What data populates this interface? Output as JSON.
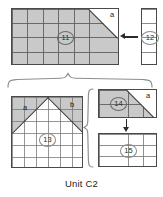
{
  "figure": {
    "caption": "Unit C2",
    "colors": {
      "shaded_fill": "#c9c9c9",
      "white_fill": "#ffffff",
      "outline": "#4a4a4a",
      "gridline": "#9a9a9a",
      "label_text": "#1a1a1a",
      "brace": "#7a7a7a",
      "arrow": "#2b2b2b"
    },
    "pieces": [
      {
        "id": "piece-11",
        "number": "11",
        "shape": "rectangle-with-corner-cut",
        "fill": "shaded",
        "grid_cols": 7,
        "grid_rows": 4,
        "corner_cut": "top-right",
        "corner_label": "a"
      },
      {
        "id": "piece-12",
        "number": "12",
        "shape": "narrow-vertical-strip",
        "fill": "white",
        "grid_cols": 1,
        "grid_rows": 4,
        "corner_cut": "none",
        "corner_label": ""
      },
      {
        "id": "piece-13",
        "number": "13",
        "shape": "square-with-peak",
        "fill": "white",
        "grid_cols": 6,
        "grid_rows": 6,
        "corner_cut": "both-top-corners",
        "corner_label_left": "a",
        "corner_label_right": "b"
      },
      {
        "id": "piece-14",
        "number": "14",
        "shape": "rectangle-with-corner-cut",
        "fill": "shaded",
        "grid_cols": 4,
        "grid_rows": 2,
        "corner_cut": "top-right",
        "corner_label": "a"
      },
      {
        "id": "piece-15",
        "number": "15",
        "shape": "rectangle",
        "fill": "white",
        "grid_cols": 4,
        "grid_rows": 3,
        "corner_cut": "none",
        "corner_label": ""
      }
    ],
    "labels": {
      "a_top": "a",
      "a_left": "a",
      "b_right": "b",
      "a_right_small": "a"
    },
    "connectors": [
      {
        "id": "arrow-12-to-11",
        "direction": "left",
        "from": "piece-12",
        "to": "piece-11"
      },
      {
        "id": "arrow-14-to-15",
        "direction": "down",
        "from": "piece-14",
        "to": "piece-15"
      }
    ],
    "braces": [
      {
        "id": "brace-top",
        "orientation": "horizontal",
        "points": "up"
      },
      {
        "id": "brace-right",
        "orientation": "vertical",
        "points": "left"
      }
    ]
  }
}
